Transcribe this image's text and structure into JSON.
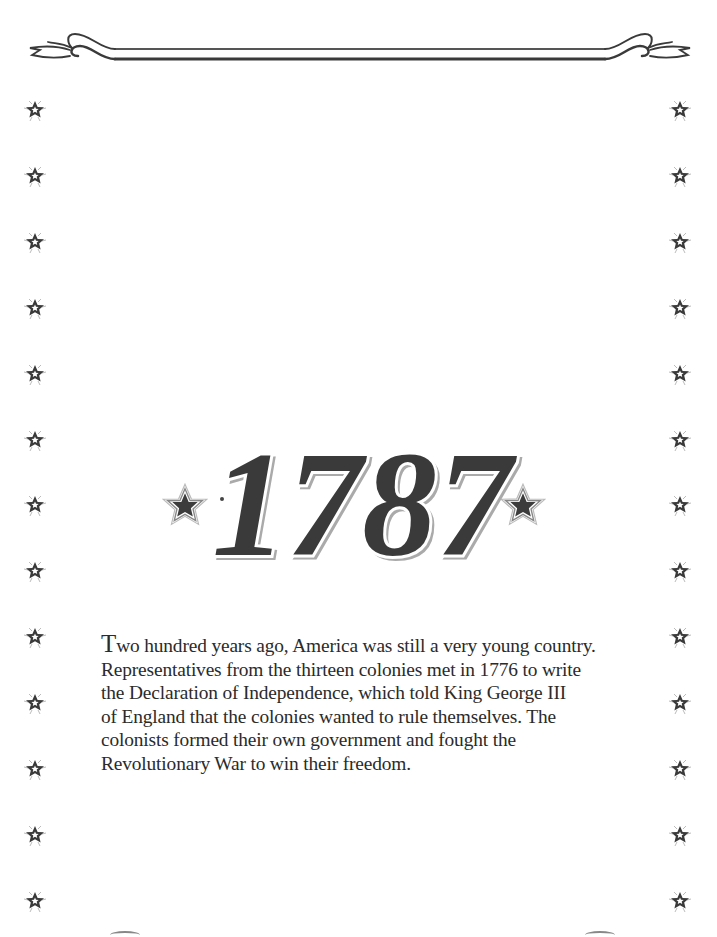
{
  "page": {
    "decoration": {
      "top_border": "ribbon-banner",
      "side_star_icon": "outlined-star-icon",
      "side_star_count_per_column": 13,
      "title_star_icon": "filled-star-icon",
      "ink_color": "#3a3a3a",
      "paper_color": "#ffffff"
    },
    "title": {
      "text": "1787",
      "digits": [
        "1",
        "7",
        "8",
        "7"
      ]
    },
    "body": {
      "drop_cap": "T",
      "lines": [
        "wo hundred years ago, America was still a very young country.",
        "Representatives from the thirteen colonies met in 1776 to write",
        "the Declaration of Independence, which told King George III",
        "of England that the colonies wanted to rule themselves. The",
        "colonists formed their own government and fought the",
        "Revolutionary War to win their freedom."
      ]
    }
  }
}
